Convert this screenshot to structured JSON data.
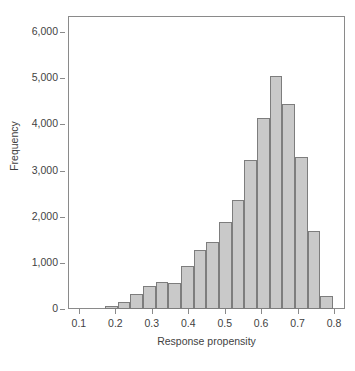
{
  "chart_data": {
    "type": "bar",
    "title": "",
    "subtitle": "",
    "xlabel": "Response propensity",
    "ylabel": "Frequency",
    "xlim": [
      0.07,
      0.83
    ],
    "ylim": [
      0,
      6350
    ],
    "grid": false,
    "legend": null,
    "bar_fill_color": "#c9c9c9",
    "bar_edge_color": "#7d7d7d",
    "axis_color": "#8a8a8a",
    "bin_width": 0.0347,
    "x_ticks": [
      {
        "value": 0.1,
        "label": "0.1"
      },
      {
        "value": 0.2,
        "label": "0.2"
      },
      {
        "value": 0.3,
        "label": "0.3"
      },
      {
        "value": 0.4,
        "label": "0.4"
      },
      {
        "value": 0.5,
        "label": "0.5"
      },
      {
        "value": 0.6,
        "label": "0.6"
      },
      {
        "value": 0.7,
        "label": "0.7"
      },
      {
        "value": 0.8,
        "label": "0.8"
      }
    ],
    "y_ticks": [
      {
        "value": 0,
        "label": "0"
      },
      {
        "value": 1000,
        "label": "1,000"
      },
      {
        "value": 2000,
        "label": "2,000"
      },
      {
        "value": 3000,
        "label": "3,000"
      },
      {
        "value": 4000,
        "label": "4,000"
      },
      {
        "value": 5000,
        "label": "5,000"
      },
      {
        "value": 6000,
        "label": "6,000"
      }
    ],
    "bins": [
      {
        "x0": 0.172,
        "x1": 0.2067,
        "value": 70
      },
      {
        "x0": 0.2067,
        "x1": 0.2414,
        "value": 160
      },
      {
        "x0": 0.2414,
        "x1": 0.2761,
        "value": 330
      },
      {
        "x0": 0.2761,
        "x1": 0.3108,
        "value": 500
      },
      {
        "x0": 0.3108,
        "x1": 0.3455,
        "value": 575
      },
      {
        "x0": 0.3455,
        "x1": 0.3802,
        "value": 570
      },
      {
        "x0": 0.3802,
        "x1": 0.4149,
        "value": 940
      },
      {
        "x0": 0.4149,
        "x1": 0.4496,
        "value": 1280
      },
      {
        "x0": 0.4496,
        "x1": 0.4843,
        "value": 1460
      },
      {
        "x0": 0.4843,
        "x1": 0.519,
        "value": 1880
      },
      {
        "x0": 0.519,
        "x1": 0.5537,
        "value": 2360
      },
      {
        "x0": 0.5537,
        "x1": 0.5884,
        "value": 3220
      },
      {
        "x0": 0.5884,
        "x1": 0.6231,
        "value": 4130
      },
      {
        "x0": 0.6231,
        "x1": 0.6578,
        "value": 5050
      },
      {
        "x0": 0.6578,
        "x1": 0.6925,
        "value": 4440
      },
      {
        "x0": 0.6925,
        "x1": 0.7272,
        "value": 3300
      },
      {
        "x0": 0.7272,
        "x1": 0.7619,
        "value": 1680
      },
      {
        "x0": 0.7619,
        "x1": 0.7966,
        "value": 290
      }
    ]
  }
}
